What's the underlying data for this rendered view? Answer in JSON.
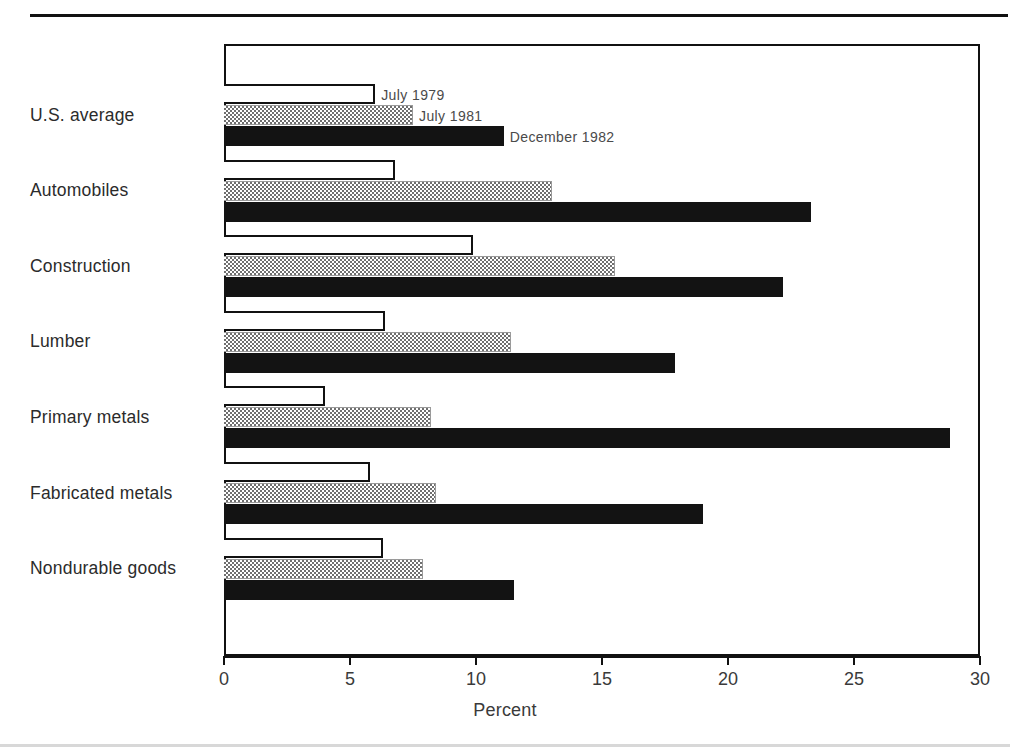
{
  "page": {
    "top_cut_text": "",
    "background": "#ffffff",
    "rule_color": "#111111"
  },
  "chart_data": {
    "type": "bar",
    "orientation": "horizontal",
    "title": "",
    "subtitle": "",
    "xlabel": "Percent",
    "ylabel": "",
    "xlim": [
      0,
      30
    ],
    "xticks": [
      0,
      5,
      10,
      15,
      20,
      25,
      30
    ],
    "xtick_labels": [
      "0",
      "5",
      "10",
      "15",
      "20",
      "25",
      "30"
    ],
    "grid": false,
    "legend_position": "inline-right-of-first-group",
    "categories": [
      "U.S. average",
      "Automobiles",
      "Construction",
      "Lumber",
      "Primary metals",
      "Fabricated metals",
      "Nondurable goods"
    ],
    "series": [
      {
        "name": "July 1979",
        "fill": "white",
        "color": "#ffffff",
        "edge_color": "#111111",
        "values": [
          6.0,
          6.8,
          9.9,
          6.4,
          4.0,
          5.8,
          6.3
        ]
      },
      {
        "name": "July 1981",
        "fill": "dotted-gray",
        "color": "#9a9a9a",
        "edge_color": "#9a9a9a",
        "values": [
          7.5,
          13.0,
          15.5,
          11.4,
          8.2,
          8.4,
          7.9
        ]
      },
      {
        "name": "December 1982",
        "fill": "solid-black",
        "color": "#131313",
        "edge_color": "#131313",
        "values": [
          11.1,
          23.3,
          22.2,
          17.9,
          28.8,
          19.0,
          11.5
        ]
      }
    ],
    "legend_entries": [
      "July 1979",
      "July 1981",
      "December 1982"
    ]
  }
}
